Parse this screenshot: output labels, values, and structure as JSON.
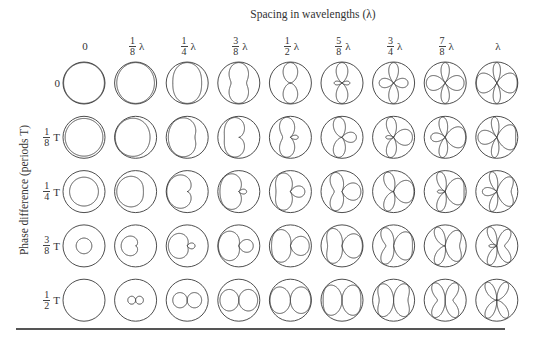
{
  "figure": {
    "title": "Spacing in wavelengths (λ)",
    "y_axis_label": "Phase difference (periods T)",
    "columns": [
      {
        "label": "0",
        "num": "",
        "den": "",
        "unit": "",
        "value": 0
      },
      {
        "label": "1/8 λ",
        "num": "1",
        "den": "8",
        "unit": "λ",
        "value": 0.125
      },
      {
        "label": "1/4 λ",
        "num": "1",
        "den": "4",
        "unit": "λ",
        "value": 0.25
      },
      {
        "label": "3/8 λ",
        "num": "3",
        "den": "8",
        "unit": "λ",
        "value": 0.375
      },
      {
        "label": "1/2 λ",
        "num": "1",
        "den": "2",
        "unit": "λ",
        "value": 0.5
      },
      {
        "label": "5/8 λ",
        "num": "5",
        "den": "8",
        "unit": "λ",
        "value": 0.625
      },
      {
        "label": "3/4 λ",
        "num": "3",
        "den": "4",
        "unit": "λ",
        "value": 0.75
      },
      {
        "label": "7/8 λ",
        "num": "7",
        "den": "8",
        "unit": "λ",
        "value": 0.875
      },
      {
        "label": "λ",
        "num": "",
        "den": "",
        "unit": "λ",
        "value": 1.0
      }
    ],
    "rows": [
      {
        "label": "0",
        "num": "",
        "den": "",
        "unit": "",
        "value": 0
      },
      {
        "label": "1/8 T",
        "num": "1",
        "den": "8",
        "unit": "T",
        "value": 0.125
      },
      {
        "label": "1/4 T",
        "num": "1",
        "den": "4",
        "unit": "T",
        "value": 0.25
      },
      {
        "label": "3/8 T",
        "num": "3",
        "den": "8",
        "unit": "T",
        "value": 0.375
      },
      {
        "label": "1/2 T",
        "num": "1",
        "den": "2",
        "unit": "T",
        "value": 0.5
      }
    ],
    "cell_description": "Radiation pattern of two isotropic sources, |cos(π·d·cosθ + π·δ)|, drawn inside a unit reference circle",
    "colors": {
      "stroke": "#3a3a3a",
      "background": "#ffffff",
      "rule": "#555555"
    }
  }
}
